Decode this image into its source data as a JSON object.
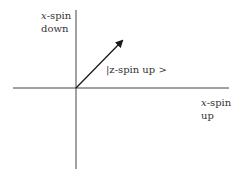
{
  "diagram": {
    "labels": {
      "vertical_axis": {
        "var": "x",
        "line1_rest": "-spin",
        "line2": "down"
      },
      "horizontal_axis": {
        "var": "x",
        "line1_rest": "-spin",
        "line2": "up"
      },
      "vector": "|z-spin up >"
    },
    "colors": {
      "line": "#333333",
      "text": "#333333",
      "background": "#ffffff"
    }
  }
}
